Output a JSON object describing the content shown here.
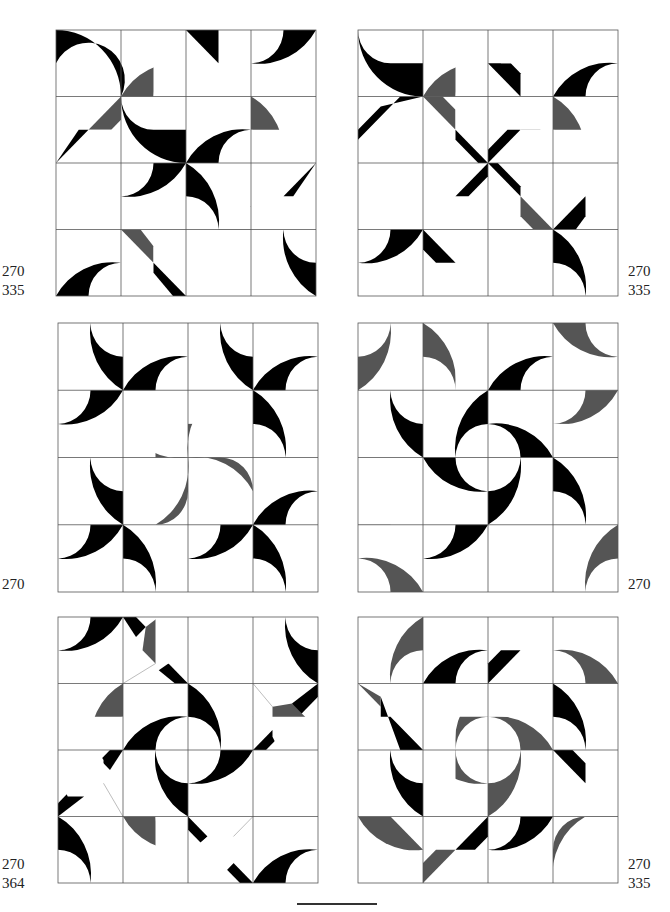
{
  "page": {
    "colors": {
      "black": "#000000",
      "hatch": "#8a8a8a",
      "grid": "#555555",
      "paper": "#ffffff"
    }
  },
  "panels": [
    {
      "id": "top-left",
      "labels": [
        "270",
        "335"
      ],
      "label_side": "left"
    },
    {
      "id": "top-right",
      "labels": [
        "270",
        "335"
      ],
      "label_side": "right"
    },
    {
      "id": "middle-left",
      "labels": [
        "270"
      ],
      "label_side": "left"
    },
    {
      "id": "middle-right",
      "labels": [
        "270"
      ],
      "label_side": "right"
    },
    {
      "id": "bottom-left",
      "labels": [
        "270",
        "364"
      ],
      "label_side": "left"
    },
    {
      "id": "bottom-right",
      "labels": [
        "270",
        "335"
      ],
      "label_side": "right"
    }
  ]
}
